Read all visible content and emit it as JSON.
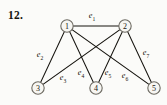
{
  "figure": {
    "problem_number": "12.",
    "width": 167,
    "height": 105,
    "background_color": "#fbfbf9",
    "edge_color": "#16140f",
    "node_fill_color": "#f7f6f2",
    "node_stroke_color": "#6d6a62"
  },
  "chart_data": {
    "type": "diagram",
    "diagram_kind": "undirected-graph",
    "title": "12.",
    "nodes": [
      {
        "id": "1",
        "label": "1",
        "x": 67,
        "y": 26,
        "r": 6.2
      },
      {
        "id": "2",
        "label": "2",
        "x": 125,
        "y": 26,
        "r": 6.2
      },
      {
        "id": "3",
        "label": "3",
        "x": 38,
        "y": 88,
        "r": 6.2
      },
      {
        "id": "4",
        "label": "4",
        "x": 96,
        "y": 88,
        "r": 6.2
      },
      {
        "id": "5",
        "label": "5",
        "x": 154,
        "y": 88,
        "r": 6.2
      }
    ],
    "edges": [
      {
        "id": "e1",
        "label": "e",
        "subscript": "1",
        "source": "1",
        "target": "2",
        "label_x": 92,
        "label_y": 15
      },
      {
        "id": "e2",
        "label": "e",
        "subscript": "2",
        "source": "1",
        "target": "3",
        "label_x": 40,
        "label_y": 54
      },
      {
        "id": "e3",
        "label": "e",
        "subscript": "3",
        "source": "2",
        "target": "3",
        "label_x": 63,
        "label_y": 77
      },
      {
        "id": "e4",
        "label": "e",
        "subscript": "4",
        "source": "1",
        "target": "4",
        "label_x": 81,
        "label_y": 72
      },
      {
        "id": "e5",
        "label": "e",
        "subscript": "5",
        "source": "2",
        "target": "4",
        "label_x": 108,
        "label_y": 72
      },
      {
        "id": "e6",
        "label": "e",
        "subscript": "6",
        "source": "1",
        "target": "5",
        "label_x": 125,
        "label_y": 75
      },
      {
        "id": "e7",
        "label": "e",
        "subscript": "7",
        "source": "2",
        "target": "5",
        "label_x": 146,
        "label_y": 52
      }
    ],
    "node_count": 5,
    "edge_count": 7
  }
}
